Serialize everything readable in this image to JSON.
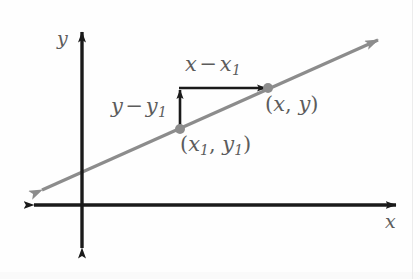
{
  "figure": {
    "background_color": "#fefefe",
    "width": 420,
    "height": 279
  },
  "axes": {
    "color": "#1a1a1a",
    "origin": {
      "x": 82,
      "y": 205
    },
    "x_label": "x",
    "y_label": "y",
    "x_axis": {
      "x1": 32,
      "y1": 205,
      "x2": 398,
      "y2": 205,
      "arrows": "both"
    },
    "y_axis": {
      "x1": 82,
      "y1": 250,
      "x2": 82,
      "y2": 30,
      "arrows": "both"
    }
  },
  "line": {
    "color": "#8c8c8c",
    "arrows": "both",
    "start": {
      "x": 42,
      "y": 190
    },
    "end": {
      "x": 378,
      "y": 40
    },
    "stroke_width": 3.2
  },
  "points": [
    {
      "name": "point-1",
      "label": "(x1, y1)",
      "label_parts": {
        "open": "(",
        "var1": "x",
        "sub1": "1",
        "comma": ", ",
        "var2": "y",
        "sub2": "1",
        "close": ")"
      },
      "x": 180,
      "y": 129,
      "color": "#8c8c8c",
      "radius": 5
    },
    {
      "name": "point-2",
      "label": "(x, y)",
      "label_parts": {
        "open": "(",
        "var1": "x",
        "sub1": "",
        "comma": ", ",
        "var2": "y",
        "sub2": "",
        "close": ")"
      },
      "x": 268,
      "y": 88,
      "color": "#8c8c8c",
      "radius": 5
    }
  ],
  "measure_arrows": {
    "color": "#1a1a1a",
    "rise": {
      "label_parts": {
        "var1": "y",
        "op": "−",
        "var2": "y",
        "sub2": "1"
      },
      "from": {
        "x": 180,
        "y": 129
      },
      "to": {
        "x": 180,
        "y": 88
      }
    },
    "run": {
      "label_parts": {
        "var1": "x",
        "op": "−",
        "var2": "x",
        "sub2": "1"
      },
      "from": {
        "x": 180,
        "y": 88
      },
      "to": {
        "x": 268,
        "y": 88
      }
    }
  },
  "labels": {
    "run": {
      "var1": "x",
      "op": "−",
      "var2": "x",
      "sub2": "1"
    },
    "rise": {
      "var1": "y",
      "op": "−",
      "var2": "y",
      "sub2": "1"
    },
    "point1": {
      "open": "(",
      "var1": "x",
      "sub1": "1",
      "comma": ",",
      "var2": "y",
      "sub2": "1",
      "close": ")"
    },
    "point2": {
      "open": "(",
      "var1": "x",
      "comma": ",",
      "var2": "y",
      "close": ")"
    },
    "axis_y": "y",
    "axis_x": "x",
    "text_color": "#5c5c5c"
  }
}
